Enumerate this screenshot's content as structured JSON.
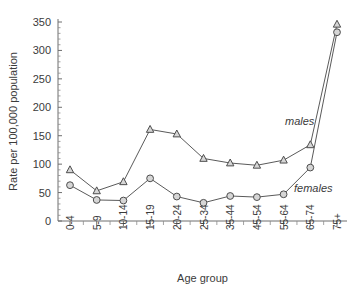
{
  "chart_data": {
    "type": "line",
    "title": "",
    "subtitle": "",
    "xlabel": "Age group",
    "ylabel": "Rate per 100,000 population",
    "categories": [
      "0-4",
      "5-9",
      "10-14",
      "15-19",
      "20-24",
      "25-34",
      "35-44",
      "45-54",
      "55-64",
      "65-74",
      "75+"
    ],
    "series": [
      {
        "name": "males",
        "marker": "triangle",
        "values": [
          90,
          53,
          69,
          161,
          153,
          110,
          102,
          98,
          107,
          134,
          346
        ]
      },
      {
        "name": "females",
        "marker": "circle",
        "values": [
          63,
          37,
          36,
          75,
          43,
          32,
          44,
          42,
          47,
          94,
          332
        ]
      }
    ],
    "ylim": [
      0,
      350
    ],
    "yticks": [
      0,
      50,
      100,
      150,
      200,
      250,
      300,
      350
    ],
    "ytick_labels": [
      "0",
      "50",
      "100",
      "150",
      "200",
      "250",
      "300",
      "350"
    ],
    "y_minor_tick_step": 10,
    "grid": false,
    "legend_position": "inline-right",
    "annotations": [
      {
        "text": "males",
        "series": "males"
      },
      {
        "text": "females",
        "series": "females"
      }
    ],
    "colors": {
      "line": "#5a5a5a",
      "marker_fill": "#d6d6d6",
      "marker_stroke": "#4d4d4d",
      "axis": "#6f6f6f",
      "text": "#3b3b3b",
      "background": "#ffffff"
    }
  }
}
